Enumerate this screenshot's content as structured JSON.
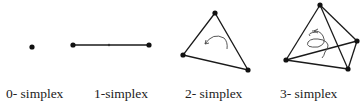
{
  "figure": {
    "labels": [
      "0- simplex",
      "1-simplex",
      "2- simplex",
      "3- simplex"
    ],
    "colors": {
      "stroke": "#1a1a1a",
      "vertex": "#111111",
      "arrow": "#444444",
      "text": "#222222"
    }
  }
}
